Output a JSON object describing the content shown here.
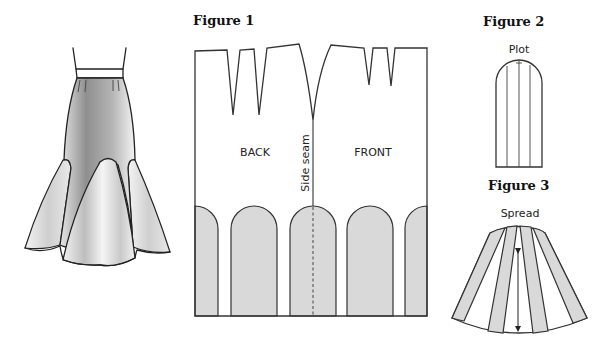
{
  "figures": {
    "illustration": {
      "name": "Trumpet skirt with godets",
      "colors": {
        "line": "#222222",
        "shade": "#8a8a8a",
        "light": "#eeeeee"
      }
    },
    "figure1": {
      "title": "Figure 1",
      "labels": {
        "back": "BACK",
        "front": "FRONT",
        "side_seam": "Side seam"
      },
      "panel_fill": "#d9d9d9",
      "panel_count": 5
    },
    "figure2": {
      "title": "Figure 2",
      "label": "Plot",
      "slash_lines": 3
    },
    "figure3": {
      "title": "Figure 3",
      "label": "Spread",
      "spread_strips": 4,
      "grainline": "double-arrow"
    }
  }
}
